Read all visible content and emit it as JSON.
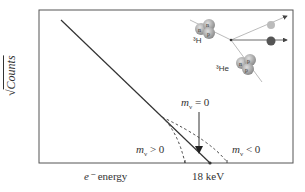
{
  "diagram": {
    "type": "Kurie plot (tritium beta decay endpoint)",
    "ylabel": "√Counts",
    "ylabel_radicand": "Counts",
    "xlabel": "e⁻ energy",
    "xlabel_particle": "e⁻",
    "xlabel_text": "energy",
    "endpoint_label": "18 keV",
    "curves": [
      {
        "name": "m_v = 0",
        "label_m": "m",
        "label_sub": "ν",
        "label_rel": "= 0",
        "style": "solid"
      },
      {
        "name": "m_v > 0",
        "label_m": "m",
        "label_sub": "ν",
        "label_rel": "> 0",
        "style": "dashed"
      },
      {
        "name": "m_v < 0",
        "label_m": "m",
        "label_sub": "ν",
        "label_rel": "< 0",
        "style": "dashed"
      }
    ],
    "inset": {
      "parent_nucleus": "³H",
      "daughter_nucleus": "³He",
      "parent_nucleons": [
        "n",
        "n",
        "p"
      ],
      "daughter_nucleons": [
        "n",
        "p",
        "p"
      ],
      "products": [
        "ν",
        "e⁻"
      ]
    },
    "colors": {
      "line": "#333333",
      "axis": "#555555",
      "nucleus": "#999999"
    }
  }
}
